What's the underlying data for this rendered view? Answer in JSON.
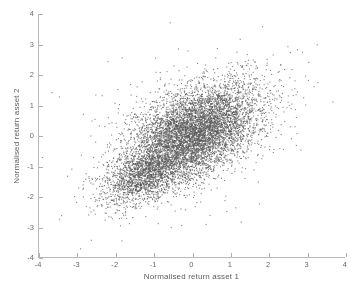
{
  "chart_data": {
    "type": "scatter",
    "title": "",
    "xlabel": "Normalised return asset 1",
    "ylabel": "Normalised return asset 2",
    "xlim": [
      -4,
      4
    ],
    "ylim": [
      -4,
      4
    ],
    "xticks": [
      -4,
      -3,
      -2,
      -1,
      0,
      1,
      2,
      3,
      4
    ],
    "yticks": [
      -4,
      -3,
      -2,
      -1,
      0,
      1,
      2,
      3,
      4
    ],
    "xticklabels": [
      "-4",
      "-3",
      "-2",
      "-1",
      "0",
      "1",
      "2",
      "3",
      "4"
    ],
    "yticklabels": [
      "-4",
      "-3",
      "-2",
      "-1",
      "0",
      "1",
      "2",
      "3",
      "4"
    ],
    "grid": false,
    "legend": null,
    "marker": {
      "style": "dot",
      "size_px": 1.1,
      "color": "#5a5a5a",
      "opacity": 0.75
    },
    "series": [
      {
        "name": "main cluster",
        "n_points": 6200,
        "distribution": "bivariate-normal",
        "mean": [
          0.05,
          0.12
        ],
        "std": [
          0.85,
          0.82
        ],
        "correlation": 0.48
      },
      {
        "name": "lower-left cluster",
        "n_points": 1500,
        "distribution": "bivariate-normal",
        "mean": [
          -1.25,
          -1.3
        ],
        "std": [
          0.55,
          0.5
        ],
        "correlation": 0.55
      },
      {
        "name": "diffuse outliers",
        "n_points": 420,
        "distribution": "bivariate-normal",
        "mean": [
          0.0,
          0.0
        ],
        "std": [
          1.45,
          1.4
        ],
        "correlation": 0.42
      }
    ],
    "observed_extent": {
      "x_min": -3.6,
      "x_max": 3.6,
      "y_min": -3.6,
      "y_max": 3.7
    }
  },
  "axes": {
    "x_tick_labels": [
      "-4",
      "-3",
      "-2",
      "-1",
      "0",
      "1",
      "2",
      "3",
      "4"
    ],
    "y_tick_labels": [
      "-4",
      "-3",
      "-2",
      "-1",
      "0",
      "1",
      "2",
      "3",
      "4"
    ],
    "x_title": "Normalised return asset 1",
    "y_title": "Normalised return asset 2"
  },
  "colors": {
    "background": "#ffffff",
    "axis_line": "#b9b9b9",
    "tick_mark": "#b0b0b0",
    "tick_label": "#6b6b6b",
    "axis_title": "#5e5e5e",
    "point": "#5a5a5a"
  }
}
